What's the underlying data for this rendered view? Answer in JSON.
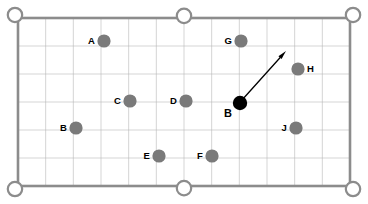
{
  "diagram": {
    "table": {
      "left": 18,
      "top": 18,
      "width": 332,
      "height": 168,
      "rail_color": "#8c8c8c",
      "rail_width": 2.6,
      "felt_color": "#ffffff",
      "grid_color": "#b9b9b9",
      "grid_width": 0.6,
      "grid_cols": 12,
      "grid_rows": 6
    },
    "pockets": {
      "radius": 7.2,
      "stroke_color": "#8c8c8c",
      "stroke_width": 2.2,
      "fill": "#ffffff",
      "items": [
        {
          "name": "pocket-top-left",
          "x": 18,
          "y": 18,
          "type": "corner"
        },
        {
          "name": "pocket-top-middle",
          "x": 184,
          "y": 18,
          "type": "side"
        },
        {
          "name": "pocket-top-right",
          "x": 350,
          "y": 18,
          "type": "corner"
        },
        {
          "name": "pocket-bottom-left",
          "x": 18,
          "y": 186,
          "type": "corner"
        },
        {
          "name": "pocket-bottom-middle",
          "x": 184,
          "y": 186,
          "type": "side"
        },
        {
          "name": "pocket-bottom-right",
          "x": 350,
          "y": 186,
          "type": "corner"
        }
      ]
    },
    "object_ball_color": "#7a7a7a",
    "cue_ball_color": "#000000",
    "ball_radius": 6.6,
    "balls": [
      {
        "name": "ball-a",
        "label": "A",
        "x": 104,
        "y": 41,
        "kind": "object",
        "label_side": "left"
      },
      {
        "name": "ball-g",
        "label": "G",
        "x": 241,
        "y": 41,
        "kind": "object",
        "label_side": "left"
      },
      {
        "name": "ball-h",
        "label": "H",
        "x": 298,
        "y": 69,
        "kind": "object",
        "label_side": "right"
      },
      {
        "name": "ball-c",
        "label": "C",
        "x": 130,
        "y": 101,
        "kind": "object",
        "label_side": "left"
      },
      {
        "name": "ball-d",
        "label": "D",
        "x": 186,
        "y": 101,
        "kind": "object",
        "label_side": "left"
      },
      {
        "name": "ball-b-lower-left",
        "label": "B",
        "x": 76,
        "y": 128,
        "kind": "object",
        "label_side": "left"
      },
      {
        "name": "ball-j",
        "label": "J",
        "x": 296,
        "y": 128,
        "kind": "object",
        "label_side": "left"
      },
      {
        "name": "ball-e",
        "label": "E",
        "x": 159,
        "y": 156,
        "kind": "object",
        "label_side": "left"
      },
      {
        "name": "ball-f",
        "label": "F",
        "x": 212,
        "y": 156,
        "kind": "object",
        "label_side": "left"
      }
    ],
    "cue_ball": {
      "name": "cue-ball-b",
      "label": "B",
      "x": 240,
      "y": 103,
      "radius": 7.2,
      "label_x": 232,
      "label_y": 113
    },
    "shot_arrow": {
      "name": "shot-direction-arrow",
      "from_x": 242,
      "from_y": 100,
      "to_x": 286,
      "to_y": 51,
      "color": "#000000",
      "line_width": 1.3,
      "head_length": 9,
      "head_width": 4.2
    }
  }
}
